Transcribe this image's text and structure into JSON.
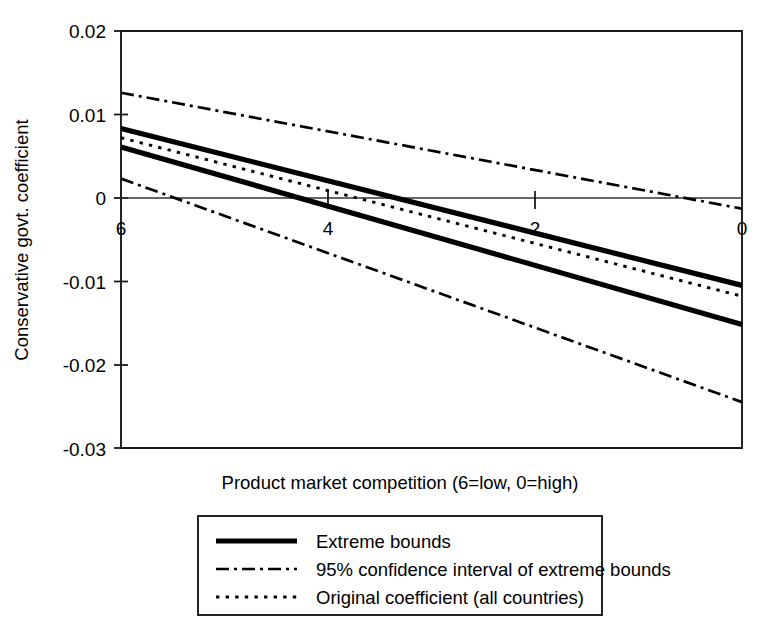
{
  "chart_data": {
    "type": "line",
    "title": "",
    "xlabel": "Product market competition (6=low, 0=high)",
    "ylabel": "Conservative govt. coefficient",
    "xlim": [
      6,
      0
    ],
    "ylim": [
      -0.03,
      0.02
    ],
    "x_ticks": [
      "6",
      "4",
      "2",
      "0"
    ],
    "x_tick_values": [
      6,
      4,
      2,
      0
    ],
    "y_ticks": [
      "0.02",
      "0.01",
      "0",
      "-0.01",
      "-0.02",
      "-0.03"
    ],
    "y_tick_values": [
      0.02,
      0.01,
      0,
      -0.01,
      -0.02,
      -0.03
    ],
    "grid": false,
    "legend_position": "below-axes",
    "x": [
      6,
      0
    ],
    "series": [
      {
        "name": "Extreme bounds (upper)",
        "style": "solid",
        "legend_key": "Extreme bounds",
        "values": [
          0.0083,
          -0.0105
        ]
      },
      {
        "name": "Extreme bounds (lower)",
        "style": "solid",
        "legend_key": "Extreme bounds",
        "values": [
          0.0061,
          -0.0152
        ]
      },
      {
        "name": "95% confidence interval of extreme bounds (upper)",
        "style": "dash-dot",
        "legend_key": "95% confidence interval of extreme bounds",
        "values": [
          0.0126,
          -0.0013
        ]
      },
      {
        "name": "95% confidence interval of extreme bounds (lower)",
        "style": "dash-dot",
        "legend_key": "95% confidence interval of extreme bounds",
        "values": [
          0.0023,
          -0.0245
        ]
      },
      {
        "name": "Original coefficient (all countries)",
        "style": "dotted",
        "legend_key": "Original coefficient (all countries)",
        "values": [
          0.0072,
          -0.0118
        ]
      }
    ],
    "legend_entries": [
      {
        "label": "Extreme bounds",
        "style": "solid"
      },
      {
        "label": "95% confidence interval of extreme bounds",
        "style": "dash-dot"
      },
      {
        "label": "Original coefficient (all countries)",
        "style": "dotted"
      }
    ],
    "colors": {
      "line": "#000000",
      "frame": "#1a1a1a",
      "background": "#ffffff"
    }
  }
}
